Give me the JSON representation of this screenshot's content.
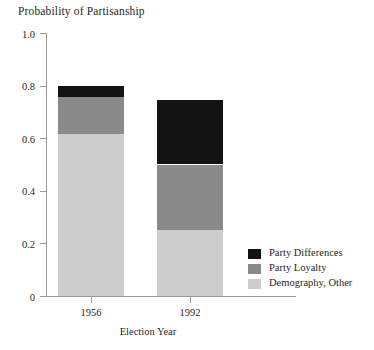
{
  "chart_data": {
    "type": "bar",
    "subtype": "stacked",
    "title": "Probability of Partisanship",
    "xlabel": "Election Year",
    "ylabel": "",
    "categories": [
      "1956",
      "1992"
    ],
    "ylim": [
      0,
      1.0
    ],
    "ytick_labels": [
      "0",
      "0.2",
      "0.4",
      "0.6",
      "0.8",
      "1.0"
    ],
    "ytick_values": [
      0,
      0.2,
      0.4,
      0.6,
      0.8,
      1.0
    ],
    "grid": false,
    "legend_position": "bottom-right",
    "series": [
      {
        "name": "Demography, Other",
        "color": "#cdcdcd",
        "values": [
          0.615,
          0.25
        ]
      },
      {
        "name": "Party Loyalty",
        "color": "#8a8a8a",
        "values": [
          0.14,
          0.25
        ]
      },
      {
        "name": "Party Differences",
        "color": "#131313",
        "values": [
          0.045,
          0.245
        ]
      }
    ],
    "totals": [
      0.8,
      0.745
    ]
  },
  "legend": {
    "items": [
      {
        "label": "Party Differences",
        "color": "#131313"
      },
      {
        "label": "Party Loyalty",
        "color": "#8a8a8a"
      },
      {
        "label": "Demography, Other",
        "color": "#cdcdcd"
      }
    ]
  },
  "axis": {
    "x_title": "Election Year"
  },
  "colors": {
    "axis": "#9a9a9a",
    "text": "#1f1f1f",
    "background": "#ffffff"
  }
}
